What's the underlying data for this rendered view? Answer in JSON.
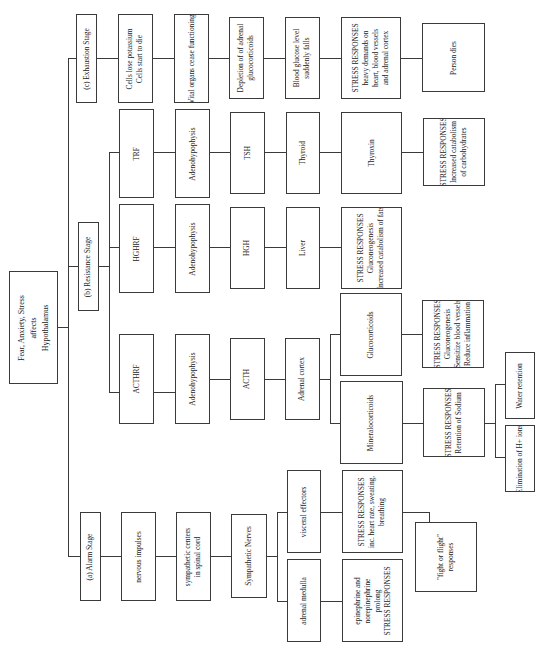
{
  "diagram": {
    "root": {
      "lines": [
        "Fear, Anxiety, Stress",
        "affects",
        "Hypothalamus"
      ]
    },
    "stages": {
      "alarm": {
        "label": "(a) Alarm Stage",
        "nervous_impulses": "nervous impulses",
        "sympathetic_centers": [
          "sympathetic centers",
          "in spinal cord"
        ],
        "sympathetic_nerves": "Sympathetic Nerves",
        "visceral_effectors": "visceral effectors",
        "visceral_responses": [
          "STRESS RESPONSES",
          "inc. heart rate, sweating,",
          "breathing"
        ],
        "adrenal_medulla": "adrenal medulla",
        "medulla_responses": [
          "epinephrine and",
          "norepinephrine",
          "prolong",
          "STRESS RESPONSES"
        ],
        "fight_or_flight": [
          "\"fight or flight\"",
          "responses"
        ]
      },
      "resistance": {
        "label": "(b) Resistance Stage",
        "branches": {
          "acth": {
            "releasing_factor": "ACTHRF",
            "gland": "Adenohypophysis",
            "hormone": "ACTH",
            "target": "Adrenal cortex",
            "glucocorticoids": "Glucocorticoids",
            "gluco_responses": [
              "STRESS RESPONSES",
              "Gluconeogenesis",
              "Sensitize blood vessels",
              "Reduce inflammation"
            ],
            "mineralocorticoids": "Mineralocorticoids",
            "mineral_responses": [
              "STRESS RESPONSES",
              "Retention of Sodium"
            ],
            "water_retention": "Water retention",
            "elimination": "Elimination of H+ ions"
          },
          "hgh": {
            "releasing_factor": "HGHRF",
            "gland": "Adenohypophysis",
            "hormone": "HGH",
            "target": "Liver",
            "responses": [
              "STRESS RESPONSES",
              "Gluconeogenesis",
              "Increased catabolism of fats"
            ]
          },
          "tsh": {
            "releasing_factor": "TRF",
            "gland": "Adenohypophysis",
            "hormone": "TSH",
            "target": "Thyroid",
            "product": "Thyroxin",
            "responses": [
              "STRESS RESPONSES",
              "Increased catabolism",
              "of carbohydrates"
            ]
          }
        }
      },
      "exhaustion": {
        "label": "(c) Exhaustion Stage",
        "step1": [
          "Cells lose potassium",
          "Cells start to die"
        ],
        "step2": "Vital organs cease functioning",
        "step3": [
          "Depletion of of adrenal",
          "glucocorticoids"
        ],
        "step4": [
          "Blood glucose level",
          "suddenly falls"
        ],
        "step5": [
          "STRESS RESPONSES",
          "heavy demands on",
          "heart, blood vessels",
          "and adrenal cortex"
        ],
        "step6": "Person dies"
      }
    }
  }
}
